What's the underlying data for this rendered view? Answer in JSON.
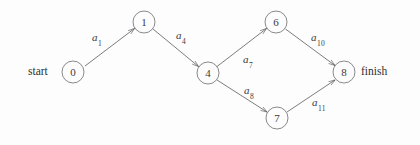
{
  "diagram": {
    "kind": "activity-on-arrow-network",
    "colors": {
      "background": "#fdfdfd",
      "stroke": "#5a5a5a",
      "node_stroke": "#6b6b6b",
      "text": "#3b3b3b"
    },
    "terminal_labels": [
      {
        "name": "start-label",
        "text": "start",
        "x": 28,
        "y": 65
      },
      {
        "name": "finish-label",
        "text": "finish",
        "x": 361,
        "y": 65
      }
    ],
    "nodes": [
      {
        "id": "0",
        "label": "0",
        "cx": 73,
        "cy": 72,
        "r": 11
      },
      {
        "id": "1",
        "label": "1",
        "cx": 144,
        "cy": 22,
        "r": 11
      },
      {
        "id": "4",
        "label": "4",
        "cx": 208,
        "cy": 73,
        "r": 11
      },
      {
        "id": "6",
        "label": "6",
        "cx": 276,
        "cy": 22,
        "r": 11
      },
      {
        "id": "7",
        "label": "7",
        "cx": 277,
        "cy": 118,
        "r": 11
      },
      {
        "id": "8",
        "label": "8",
        "cx": 344,
        "cy": 72,
        "r": 11
      }
    ],
    "edges": [
      {
        "id": "e1",
        "from": "0",
        "to": "1",
        "label": "a",
        "subscript": "1",
        "label_x": 92,
        "label_y": 31
      },
      {
        "id": "e4",
        "from": "1",
        "to": "4",
        "label": "a",
        "subscript": "4",
        "label_x": 176,
        "label_y": 29
      },
      {
        "id": "e7",
        "from": "4",
        "to": "6",
        "label": "a",
        "subscript": "7",
        "label_x": 243,
        "label_y": 53
      },
      {
        "id": "e8",
        "from": "4",
        "to": "7",
        "label": "a",
        "subscript": "8",
        "label_x": 244,
        "label_y": 84
      },
      {
        "id": "e10",
        "from": "6",
        "to": "8",
        "label": "a",
        "subscript": "10",
        "label_x": 311,
        "label_y": 31
      },
      {
        "id": "e11",
        "from": "7",
        "to": "8",
        "label": "a",
        "subscript": "11",
        "label_x": 312,
        "label_y": 96
      }
    ]
  }
}
